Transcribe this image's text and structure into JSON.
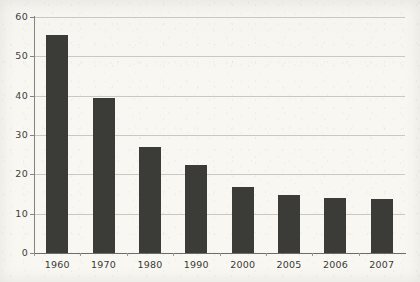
{
  "chart_data": {
    "type": "bar",
    "title": "",
    "subtitle": "",
    "xlabel": "",
    "ylabel": "",
    "categories": [
      "1960",
      "1970",
      "1980",
      "1990",
      "2000",
      "2005",
      "2006",
      "2007"
    ],
    "values": [
      55.5,
      39.5,
      27,
      22.3,
      16.8,
      14.8,
      14,
      13.8
    ],
    "ylim": [
      0,
      60
    ],
    "yticks": [
      0,
      10,
      20,
      30,
      40,
      50,
      60
    ],
    "ytick_labels": [
      "0",
      "10",
      "20",
      "30",
      "40",
      "50",
      "60"
    ],
    "grid": true,
    "legend": false,
    "legend_position": "none",
    "series": [
      {
        "name": "",
        "values": [
          55.5,
          39.5,
          27,
          22.3,
          16.8,
          14.8,
          14,
          13.8
        ]
      }
    ],
    "annotations": []
  },
  "style": {
    "bar_color": "#3b3b38",
    "grid_color": "#c9c8c1",
    "axis_color": "#85847e",
    "background_color": "#f8f7f2",
    "text_color": "#3a3a36"
  }
}
